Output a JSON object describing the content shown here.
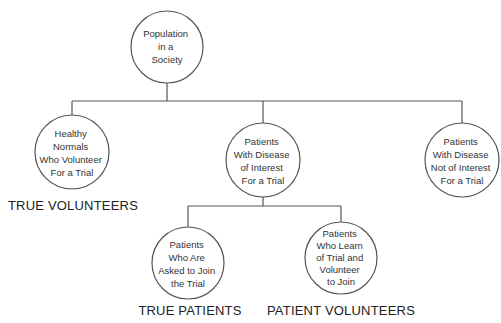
{
  "diagram": {
    "type": "tree",
    "nodes": {
      "root": {
        "lines": [
          "Population",
          "in a",
          "Society"
        ]
      },
      "healthy_normals": {
        "lines": [
          "Healthy",
          "Normals",
          "Who Volunteer",
          "For a Trial"
        ]
      },
      "disease_of_interest": {
        "lines": [
          "Patients",
          "With Disease",
          "of Interest",
          "For a Trial"
        ]
      },
      "disease_not_of_interest": {
        "lines": [
          "Patients",
          "With Disease",
          "Not of Interest",
          "For a Trial"
        ]
      },
      "asked_to_join": {
        "lines": [
          "Patients",
          "Who Are",
          "Asked to Join",
          "the Trial"
        ]
      },
      "learn_and_volunteer": {
        "lines": [
          "Patients",
          "Who Learn",
          "of Trial and",
          "Volunteer",
          "to Join"
        ]
      }
    },
    "edges": [
      [
        "root",
        "healthy_normals"
      ],
      [
        "root",
        "disease_of_interest"
      ],
      [
        "root",
        "disease_not_of_interest"
      ],
      [
        "disease_of_interest",
        "asked_to_join"
      ],
      [
        "disease_of_interest",
        "learn_and_volunteer"
      ]
    ],
    "labels": {
      "true_volunteers": "TRUE VOLUNTEERS",
      "true_patients": "TRUE PATIENTS",
      "patient_volunteers": "PATIENT VOLUNTEERS"
    },
    "colors": {
      "line": "#555555",
      "text": "#333333",
      "background": "#ffffff"
    }
  }
}
